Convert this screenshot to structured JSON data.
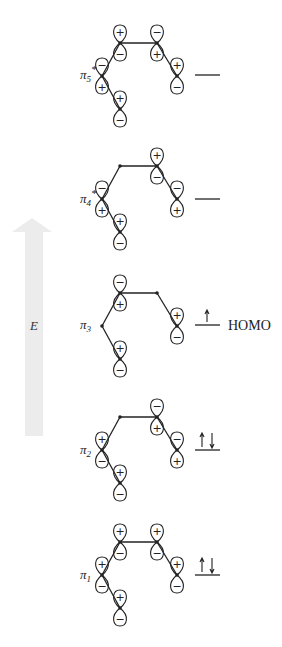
{
  "energy_axis": {
    "label": "E",
    "color": "#ececec",
    "tip_y": 218,
    "bottom_y": 436
  },
  "atom_offsets": [
    {
      "id": "A",
      "dx": 0,
      "dy": 0
    },
    {
      "id": "B",
      "dx": 37,
      "dy": 0
    },
    {
      "id": "C",
      "dx": -18,
      "dy": 33
    },
    {
      "id": "D",
      "dx": 0,
      "dy": 66
    },
    {
      "id": "E",
      "dx": 57,
      "dy": 33
    }
  ],
  "bonds": [
    [
      "A",
      "B"
    ],
    [
      "A",
      "C"
    ],
    [
      "C",
      "D"
    ],
    [
      "B",
      "E"
    ]
  ],
  "levels": [
    {
      "name": "pi5-star",
      "label": "π",
      "sub": "5",
      "star": "*",
      "ox": 120,
      "oy": 43,
      "line_y": 75,
      "phases": {
        "A": [
          "+",
          "-"
        ],
        "B": [
          "-",
          "+"
        ],
        "C": [
          "-",
          "+"
        ],
        "D": [
          "+",
          "-"
        ],
        "E": [
          "+",
          "-"
        ]
      },
      "electrons": "",
      "tag": ""
    },
    {
      "name": "pi4-star",
      "label": "π",
      "sub": "4",
      "star": "*",
      "ox": 120,
      "oy": 166,
      "line_y": 199,
      "phases": {
        "A": null,
        "B": [
          "+",
          "-"
        ],
        "C": [
          "-",
          "+"
        ],
        "D": [
          "+",
          "-"
        ],
        "E": [
          "-",
          "+"
        ]
      },
      "electrons": "",
      "tag": ""
    },
    {
      "name": "pi3",
      "label": "π",
      "sub": "3",
      "star": "",
      "ox": 120,
      "oy": 293,
      "line_y": 325,
      "phases": {
        "A": [
          "-",
          "+"
        ],
        "B": null,
        "C": null,
        "D": [
          "+",
          "-"
        ],
        "E": [
          "+",
          "-"
        ]
      },
      "electrons": "↑",
      "tag": "HOMO"
    },
    {
      "name": "pi2",
      "label": "π",
      "sub": "2",
      "star": "",
      "ox": 120,
      "oy": 417,
      "line_y": 450,
      "phases": {
        "A": null,
        "B": [
          "-",
          "+"
        ],
        "C": [
          "+",
          "-"
        ],
        "D": [
          "+",
          "-"
        ],
        "E": [
          "-",
          "+"
        ]
      },
      "electrons": "↑↓",
      "tag": ""
    },
    {
      "name": "pi1",
      "label": "π",
      "sub": "1",
      "star": "",
      "ox": 120,
      "oy": 542,
      "line_y": 575,
      "phases": {
        "A": [
          "+",
          "-"
        ],
        "B": [
          "+",
          "-"
        ],
        "C": [
          "+",
          "-"
        ],
        "D": [
          "+",
          "-"
        ],
        "E": [
          "+",
          "-"
        ]
      },
      "electrons": "↑↓",
      "tag": ""
    }
  ]
}
